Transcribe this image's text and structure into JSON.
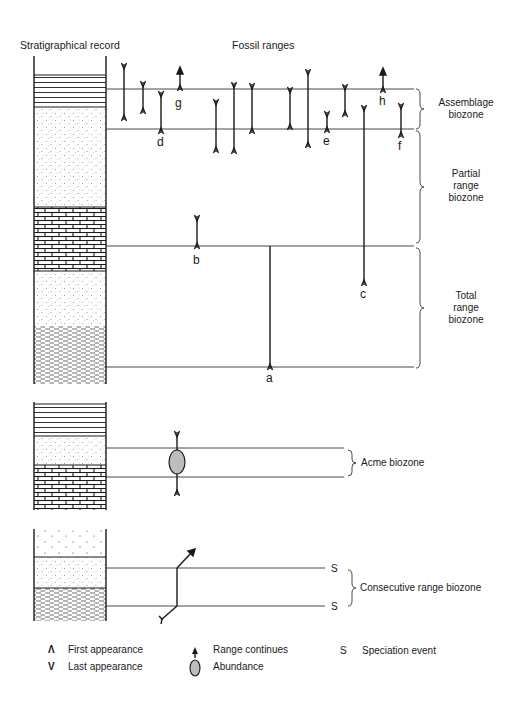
{
  "headers": {
    "strat_record": "Stratigraphical record",
    "fossil_ranges": "Fossil ranges"
  },
  "zones": {
    "assemblage": [
      "Assemblage",
      "biozone"
    ],
    "partial": [
      "Partial",
      "range",
      "biozone"
    ],
    "total": [
      "Total",
      "range",
      "biozone"
    ],
    "acme": "Acme biozone",
    "consecutive": "Consecutive range biozone"
  },
  "taxa_labels": {
    "a": "a",
    "b": "b",
    "c": "c",
    "d": "d",
    "e": "e",
    "f": "f",
    "g": "g",
    "h": "h"
  },
  "speciation_marks": [
    "S",
    "S"
  ],
  "legend": {
    "first_appearance": {
      "symbol": "Λ",
      "label": "First appearance"
    },
    "last_appearance": {
      "symbol": "V",
      "label": "Last appearance"
    },
    "range_continues": {
      "symbol": "arrow-up",
      "label": "Range continues"
    },
    "abundance": {
      "symbol": "ellipse",
      "label": "Abundance"
    },
    "speciation": {
      "symbol": "S",
      "label": "Speciation event"
    }
  },
  "colors": {
    "line": "#1a1a1a",
    "abundance_fill": "#bdbdbd"
  }
}
